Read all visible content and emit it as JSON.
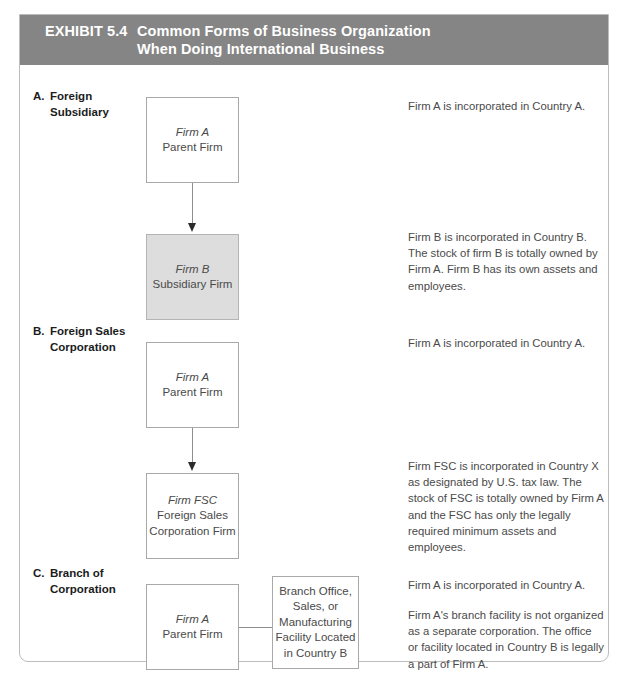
{
  "exhibit": {
    "number_label": "EXHIBIT 5.4",
    "title_line1": "Common Forms of Business Organization",
    "title_line2": "When Doing International Business",
    "header_color": "#858585",
    "shaded_box_color": "#dddddd",
    "frame_border_color": "#bcbcbc"
  },
  "sections": [
    {
      "letter": "A.",
      "label_line1": "Foreign",
      "label_line2": "Subsidiary",
      "boxes": [
        {
          "italic_line": "Firm A",
          "line2": "Parent Firm",
          "shaded": false
        },
        {
          "italic_line": "Firm B",
          "line2": "Subsidiary Firm",
          "shaded": true
        }
      ],
      "descriptions": [
        "Firm A is incorporated in Country A.",
        "Firm B is incorporated in Country B. The stock of firm B is totally owned by Firm A. Firm B has its own assets and employees."
      ]
    },
    {
      "letter": "B.",
      "label_line1": "Foreign Sales",
      "label_line2": "Corporation",
      "boxes": [
        {
          "italic_line": "Firm A",
          "line2": "Parent Firm",
          "shaded": false
        },
        {
          "italic_line": "Firm FSC",
          "line2": "Foreign Sales",
          "line3": "Corporation Firm",
          "shaded": false
        }
      ],
      "descriptions": [
        "Firm A is incorporated in Country A.",
        "Firm FSC is incorporated in Country X as designated by U.S. tax law. The stock of FSC is totally owned by Firm A and the FSC has only the legally required minimum assets and employees."
      ]
    },
    {
      "letter": "C.",
      "label_line1": "Branch of",
      "label_line2": "Corporation",
      "boxes": [
        {
          "italic_line": "Firm A",
          "line2": "Parent Firm",
          "shaded": false
        },
        {
          "line1": "Branch Office,",
          "line2": "Sales, or",
          "line3": "Manufacturing",
          "line4": "Facility Located",
          "line5": "in Country B",
          "shaded": false
        }
      ],
      "descriptions": [
        "Firm A is incorporated in Country A.",
        "Firm A's branch facility is not organized as a separate corporation. The office or facility located in Country B is legally a part of Firm A."
      ]
    }
  ]
}
